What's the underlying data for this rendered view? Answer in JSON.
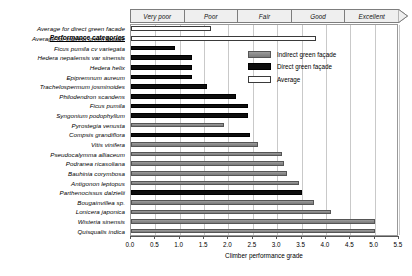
{
  "chart_data": {
    "type": "bar",
    "orientation": "horizontal",
    "title": "",
    "xlabel": "Climber performance grade",
    "ylabel": "",
    "xlim": [
      0.0,
      5.5
    ],
    "xticks": [
      "0.0",
      "0.5",
      "1.0",
      "1.5",
      "2.0",
      "2.5",
      "3.0",
      "3.5",
      "4.0",
      "4.5",
      "5.0",
      "5.5"
    ],
    "grid": true,
    "legend_position": "upper-right",
    "header_label": "Performance categories",
    "performance_categories": [
      "Very poor",
      "Poor",
      "Fair",
      "Good",
      "Excellent"
    ],
    "legend": [
      {
        "label": "Indirect green façade",
        "key": "indirect",
        "color": "#8a8a8a"
      },
      {
        "label": "Direct green façade",
        "key": "direct",
        "color": "#0d0d0d"
      },
      {
        "label": "Average",
        "key": "average",
        "color": "#ffffff"
      }
    ],
    "categories": [
      "Average for direct green facade",
      "Average for indirect green facade",
      "Ficus pumila cv variegata",
      "Hedera nepalensis var sinensis",
      "Hedera helix",
      "Epipremnum aureum",
      "Trachelospermum josminoides",
      "Philodendron scandens",
      "Ficus pumila",
      "Syngonium podophyllum",
      "Pyrostegia venusta",
      "Compsis grandiflora",
      "Vitis vinifera",
      "Pseudocalymma alliaceum",
      "Podranea ricasoliana",
      "Bauhinia corymbosa",
      "Antigonon leptopus",
      "Parthenocissus dalzielii",
      "Bougainvillea sp.",
      "Lonicera japonica",
      "Wisteria sinensis",
      "Quisqualis indica"
    ],
    "values": [
      1.65,
      3.8,
      0.9,
      1.25,
      1.25,
      1.25,
      1.55,
      2.15,
      2.4,
      2.4,
      1.9,
      2.45,
      2.6,
      3.1,
      3.15,
      3.2,
      3.45,
      3.5,
      3.75,
      4.1,
      5.0,
      5.0
    ],
    "series_key": [
      "average",
      "average",
      "direct",
      "direct",
      "direct",
      "direct",
      "direct",
      "direct",
      "direct",
      "direct",
      "indirect",
      "direct",
      "indirect",
      "indirect",
      "indirect",
      "indirect",
      "indirect",
      "direct",
      "indirect",
      "indirect",
      "indirect",
      "indirect"
    ]
  }
}
